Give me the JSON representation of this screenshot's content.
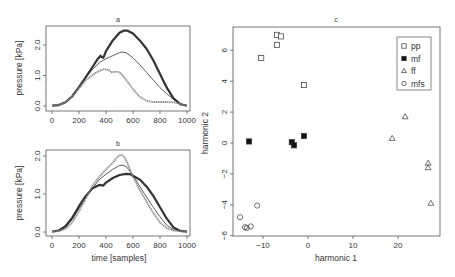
{
  "colors": {
    "axis": "#444444",
    "text": "#333333",
    "dark": "#333333",
    "mid": "#555555",
    "light": "#888888"
  },
  "chart_data": [
    {
      "id": "a",
      "type": "line",
      "title": "a",
      "xlabel": "",
      "ylabel": "pressure [kPa]",
      "xlim": [
        0,
        1000
      ],
      "ylim": [
        0,
        2.5
      ],
      "xticks": [
        0,
        200,
        400,
        600,
        800,
        1000
      ],
      "yticks": [
        0.0,
        1.0,
        2.0
      ],
      "ytick_labels": [
        "0.0",
        "1.0",
        "2.0"
      ],
      "series": [
        {
          "name": "thick dotted (pp)",
          "style": "thick",
          "x": [
            0,
            50,
            100,
            150,
            200,
            250,
            300,
            340,
            360,
            370,
            380,
            400,
            450,
            500,
            530,
            560,
            600,
            650,
            700,
            750,
            800,
            850,
            900,
            950,
            1000
          ],
          "y": [
            0.01,
            0.03,
            0.12,
            0.32,
            0.62,
            0.95,
            1.28,
            1.55,
            1.65,
            1.6,
            1.58,
            1.8,
            2.15,
            2.4,
            2.47,
            2.47,
            2.38,
            2.15,
            1.88,
            1.5,
            1.05,
            0.6,
            0.25,
            0.06,
            0.01
          ]
        },
        {
          "name": "thin solid",
          "style": "thin",
          "x": [
            0,
            50,
            100,
            150,
            200,
            250,
            300,
            350,
            380,
            400,
            450,
            500,
            520,
            550,
            600,
            650,
            700,
            750,
            800,
            850,
            900,
            950,
            1000
          ],
          "y": [
            0.01,
            0.03,
            0.12,
            0.3,
            0.6,
            0.92,
            1.2,
            1.42,
            1.5,
            1.55,
            1.65,
            1.75,
            1.77,
            1.74,
            1.58,
            1.35,
            1.1,
            0.85,
            0.6,
            0.4,
            0.22,
            0.08,
            0.01
          ]
        },
        {
          "name": "grey dotted",
          "style": "light",
          "x": [
            0,
            50,
            100,
            150,
            200,
            250,
            300,
            350,
            380,
            400,
            420,
            440,
            460,
            480,
            500,
            520,
            550,
            600,
            650,
            700,
            750,
            800,
            850,
            900,
            950,
            1000
          ],
          "y": [
            0.01,
            0.03,
            0.12,
            0.3,
            0.58,
            0.85,
            1.02,
            1.15,
            1.2,
            1.2,
            1.18,
            1.1,
            1.12,
            1.12,
            1.1,
            1.02,
            0.85,
            0.55,
            0.3,
            0.17,
            0.13,
            0.13,
            0.13,
            0.12,
            0.07,
            0.01
          ]
        }
      ]
    },
    {
      "id": "b",
      "type": "line",
      "title": "b",
      "xlabel": "time [samples]",
      "ylabel": "pressure [kPa]",
      "xlim": [
        0,
        1000
      ],
      "ylim": [
        0,
        2.05
      ],
      "xticks": [
        0,
        200,
        400,
        600,
        800,
        1000
      ],
      "yticks": [
        0.0,
        1.0,
        2.0
      ],
      "ytick_labels": [
        "0.0",
        "1.0",
        "2.0"
      ],
      "series": [
        {
          "name": "thick dotted",
          "style": "thick",
          "x": [
            0,
            50,
            100,
            150,
            200,
            250,
            300,
            350,
            380,
            400,
            450,
            500,
            550,
            580,
            600,
            650,
            700,
            750,
            800,
            850,
            900,
            950,
            1000
          ],
          "y": [
            0.01,
            0.04,
            0.15,
            0.38,
            0.68,
            0.95,
            1.15,
            1.24,
            1.22,
            1.3,
            1.42,
            1.5,
            1.53,
            1.52,
            1.48,
            1.38,
            1.2,
            0.95,
            0.65,
            0.35,
            0.12,
            0.03,
            0.01
          ]
        },
        {
          "name": "thin solid",
          "style": "thin",
          "x": [
            0,
            50,
            100,
            150,
            200,
            250,
            300,
            350,
            400,
            450,
            500,
            520,
            550,
            600,
            650,
            700,
            750,
            800,
            850,
            900,
            950,
            1000
          ],
          "y": [
            0.01,
            0.03,
            0.12,
            0.33,
            0.62,
            0.9,
            1.15,
            1.38,
            1.52,
            1.65,
            1.75,
            1.76,
            1.72,
            1.5,
            1.2,
            0.92,
            0.65,
            0.4,
            0.18,
            0.06,
            0.02,
            0.01
          ]
        },
        {
          "name": "grey dotted",
          "style": "light",
          "x": [
            0,
            50,
            100,
            150,
            200,
            250,
            300,
            350,
            400,
            450,
            480,
            500,
            520,
            540,
            560,
            600,
            650,
            700,
            750,
            800,
            850,
            900,
            950,
            1000
          ],
          "y": [
            0.01,
            0.02,
            0.08,
            0.25,
            0.55,
            0.88,
            1.22,
            1.45,
            1.65,
            1.82,
            1.96,
            2.02,
            2.02,
            1.95,
            1.8,
            1.45,
            1.1,
            0.8,
            0.5,
            0.25,
            0.1,
            0.04,
            0.02,
            0.01
          ]
        }
      ]
    },
    {
      "id": "c",
      "type": "scatter",
      "title": "c",
      "xlabel": "harmonic 1",
      "ylabel": "harmonic 2",
      "xlim": [
        -16.8,
        29.3
      ],
      "ylim": [
        -6.0,
        7.4
      ],
      "xticks": [
        -10,
        0,
        10,
        20
      ],
      "xtick_labels": [
        "−10",
        "0",
        "10",
        "20"
      ],
      "yticks": [
        -6,
        -4,
        -2,
        0,
        2,
        4,
        6
      ],
      "ytick_labels": [
        "−6",
        "−4",
        "−2",
        "0",
        "2",
        "4",
        "6"
      ],
      "legend": {
        "position": "top-right",
        "entries": [
          {
            "label": "pp",
            "marker": "open-square"
          },
          {
            "label": "mf",
            "marker": "filled-square"
          },
          {
            "label": "ff",
            "marker": "open-triangle"
          },
          {
            "label": "mfs",
            "marker": "open-circle"
          }
        ]
      },
      "series": [
        {
          "name": "pp",
          "marker": "open-square",
          "points": [
            [
              -10.4,
              5.5
            ],
            [
              -6.9,
              7.0
            ],
            [
              -6.0,
              6.9
            ],
            [
              -6.9,
              6.35
            ],
            [
              -0.9,
              3.75
            ]
          ]
        },
        {
          "name": "mf",
          "marker": "filled-square",
          "points": [
            [
              -13.1,
              0.1
            ],
            [
              -3.6,
              0.05
            ],
            [
              -3.1,
              -0.15
            ],
            [
              -0.9,
              0.45
            ]
          ]
        },
        {
          "name": "ff",
          "marker": "open-triangle",
          "points": [
            [
              18.7,
              0.3
            ],
            [
              21.6,
              1.7
            ],
            [
              26.7,
              -1.3
            ],
            [
              26.7,
              -1.6
            ],
            [
              27.3,
              -3.9
            ]
          ]
        },
        {
          "name": "mfs",
          "marker": "open-circle",
          "points": [
            [
              -15.1,
              -4.8
            ],
            [
              -14.0,
              -5.45
            ],
            [
              -13.6,
              -5.5
            ],
            [
              -12.7,
              -5.4
            ],
            [
              -11.3,
              -4.05
            ]
          ]
        }
      ]
    }
  ]
}
